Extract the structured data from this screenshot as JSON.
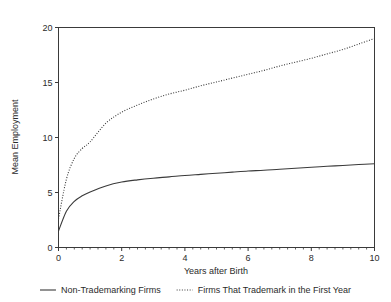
{
  "chart_data": {
    "type": "line",
    "title": "",
    "xlabel": "Years after Birth",
    "ylabel": "Mean Employment",
    "xlim": [
      0,
      10
    ],
    "ylim": [
      0,
      20
    ],
    "grid": false,
    "legend_position": "bottom",
    "x_ticks": [
      "0",
      "2",
      "4",
      "6",
      "8",
      "10"
    ],
    "x_tick_values": [
      0,
      2,
      4,
      6,
      8,
      10
    ],
    "y_ticks": [
      "0",
      "5",
      "10",
      "15",
      "20"
    ],
    "y_tick_values": [
      0,
      5,
      10,
      15,
      20
    ],
    "x": [
      0,
      0.25,
      0.5,
      0.75,
      1,
      1.5,
      2,
      2.5,
      3,
      3.5,
      4,
      4.5,
      5,
      5.5,
      6,
      6.5,
      7,
      7.5,
      8,
      8.5,
      9,
      9.5,
      10
    ],
    "series": [
      {
        "name": "Non-Trademarking Firms",
        "style": "solid",
        "color": "#3a3a3a",
        "values": [
          1.5,
          3.3,
          4.2,
          4.7,
          5.05,
          5.6,
          5.95,
          6.15,
          6.3,
          6.42,
          6.55,
          6.65,
          6.75,
          6.85,
          6.95,
          7.02,
          7.12,
          7.2,
          7.3,
          7.38,
          7.46,
          7.54,
          7.62
        ]
      },
      {
        "name": "Firms That Trademark in the First Year",
        "style": "dotted",
        "color": "#3a3a3a",
        "values": [
          2.6,
          6.2,
          8.1,
          9.0,
          9.6,
          11.3,
          12.3,
          12.95,
          13.5,
          13.95,
          14.3,
          14.7,
          15.05,
          15.4,
          15.75,
          16.1,
          16.5,
          16.85,
          17.2,
          17.6,
          18.0,
          18.5,
          19.0
        ]
      }
    ]
  },
  "legend": {
    "items": [
      {
        "label": "Non-Trademarking Firms",
        "style": "solid"
      },
      {
        "label": "Firms That Trademark in the First Year",
        "style": "dotted"
      }
    ]
  }
}
